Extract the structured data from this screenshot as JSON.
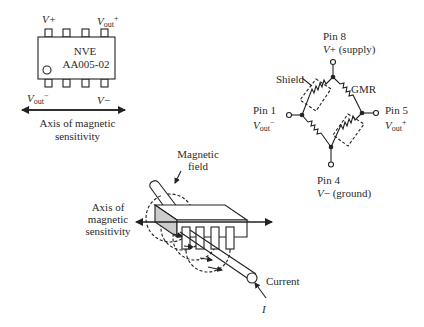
{
  "chip": {
    "label_line1": "NVE",
    "label_line2": "AA005-02",
    "pin_top_left": "V+",
    "pin_top_right_main": "V",
    "pin_top_right_sub": "out",
    "pin_top_right_sup": "+",
    "pin_bottom_left_main": "V",
    "pin_bottom_left_sub": "out",
    "pin_bottom_left_sup": "−",
    "pin_bottom_right": "V−",
    "axis_label_line1": "Axis of magnetic",
    "axis_label_line2": "sensitivity"
  },
  "bridge": {
    "pin8_name": "Pin 8",
    "pin8_desc": "V+ (supply)",
    "pin1_name": "Pin 1",
    "pin1_main": "V",
    "pin1_sub": "out",
    "pin1_sup": "−",
    "pin5_name": "Pin 5",
    "pin5_main": "V",
    "pin5_sub": "out",
    "pin5_sup": "+",
    "pin4_name": "Pin 4",
    "pin4_desc": "V− (ground)",
    "shield_label": "Shield",
    "gmr_label": "GMR"
  },
  "sensor_3d": {
    "magnetic_field_line1": "Magnetic",
    "magnetic_field_line2": "field",
    "axis_line1": "Axis of",
    "axis_line2": "magnetic",
    "axis_line3": "sensitivity",
    "current_label": "Current",
    "current_symbol": "I"
  }
}
